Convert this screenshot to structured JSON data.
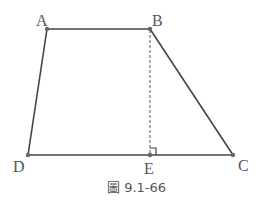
{
  "figure": {
    "caption": "圖 9.1-66",
    "shape": "trapezoid",
    "points": {
      "A": {
        "label": "A",
        "x": 47,
        "y": 29
      },
      "B": {
        "label": "B",
        "x": 150,
        "y": 29
      },
      "C": {
        "label": "C",
        "x": 233,
        "y": 155
      },
      "D": {
        "label": "D",
        "x": 28,
        "y": 155
      },
      "E": {
        "label": "E",
        "x": 150,
        "y": 155
      }
    },
    "segments": [
      "AB",
      "BC",
      "CD",
      "DA"
    ],
    "dashed_segments": [
      "BE"
    ],
    "right_angle_at": "E",
    "colors": {
      "line": "#444444",
      "point": "#666666",
      "label": "#555555"
    }
  }
}
